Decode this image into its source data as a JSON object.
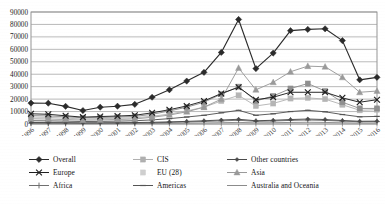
{
  "chart_data": {
    "type": "line",
    "title": "",
    "xlabel": "",
    "ylabel": "",
    "grid": true,
    "legend_position": "bottom",
    "ylim": [
      0,
      90000
    ],
    "ytick_step": 10000,
    "yticks": [
      "0",
      "10000",
      "20000",
      "30000",
      "40000",
      "50000",
      "60000",
      "70000",
      "80000",
      "90000"
    ],
    "categories": [
      "1996",
      "1997",
      "1998",
      "1999",
      "2000",
      "2001",
      "2002",
      "2003",
      "2004",
      "2005",
      "2006",
      "2007",
      "2008",
      "2009",
      "2010",
      "2011",
      "2012",
      "2013",
      "2014",
      "2015",
      "2016"
    ],
    "series": [
      {
        "name": "Overall",
        "color": "#2b2b2b",
        "marker": "diamond",
        "values": [
          16800,
          16700,
          14200,
          10800,
          13500,
          14300,
          15800,
          21500,
          27500,
          34500,
          41500,
          57500,
          84000,
          44500,
          57000,
          75000,
          76000,
          76500,
          67000,
          35500,
          37500
        ]
      },
      {
        "name": "CIS",
        "color": "#8f8f8f",
        "marker": "square",
        "values": [
          6800,
          6500,
          5800,
          5000,
          5200,
          5600,
          6100,
          7800,
          10500,
          13500,
          17500,
          24000,
          30000,
          18500,
          22500,
          28500,
          32500,
          26500,
          17500,
          12500,
          12500
        ]
      },
      {
        "name": "Other countries",
        "color": "#4a4a4a",
        "marker": "diamond-small",
        "values": [
          1200,
          1150,
          1100,
          950,
          1000,
          1050,
          1150,
          1400,
          1700,
          2100,
          2600,
          3200,
          3800,
          2600,
          3000,
          3600,
          4000,
          3600,
          2800,
          2200,
          2300
        ]
      },
      {
        "name": "Europe",
        "color": "#1f1f1f",
        "marker": "cross",
        "values": [
          8200,
          7800,
          6600,
          5500,
          6000,
          6400,
          7000,
          9000,
          11500,
          14500,
          18500,
          24500,
          29500,
          19500,
          21500,
          25500,
          25500,
          25500,
          21000,
          17500,
          19500
        ]
      },
      {
        "name": "EU (28)",
        "color": "#b5b5b5",
        "marker": "square-light",
        "values": [
          5600,
          5300,
          4700,
          4000,
          4300,
          4600,
          5000,
          6200,
          8000,
          10500,
          13500,
          18500,
          23000,
          14500,
          16500,
          20500,
          21000,
          20000,
          15500,
          11000,
          11500
        ]
      },
      {
        "name": "Asia",
        "color": "#9a9a9a",
        "marker": "triangle",
        "values": [
          4200,
          4000,
          3600,
          3100,
          3300,
          3600,
          4100,
          5400,
          7200,
          9800,
          13500,
          20000,
          45000,
          27500,
          33500,
          42000,
          46500,
          46000,
          37500,
          25500,
          26500
        ]
      },
      {
        "name": "Africa",
        "color": "#707070",
        "marker": "plus",
        "values": [
          700,
          700,
          650,
          600,
          650,
          700,
          800,
          1000,
          1300,
          1600,
          2000,
          2500,
          3000,
          2100,
          2400,
          2900,
          3200,
          2900,
          2300,
          1800,
          1900
        ]
      },
      {
        "name": "Americas",
        "color": "#555555",
        "marker": "dash",
        "values": [
          2600,
          2500,
          2300,
          2000,
          2100,
          2300,
          2600,
          3300,
          4300,
          5600,
          7000,
          9000,
          11000,
          7000,
          8200,
          10000,
          11000,
          9800,
          7600,
          5800,
          6100
        ]
      },
      {
        "name": "Australia and Oceania",
        "color": "#8c8c8c",
        "marker": "line-only",
        "values": [
          300,
          300,
          280,
          250,
          260,
          280,
          320,
          400,
          520,
          650,
          820,
          1050,
          1300,
          900,
          1050,
          1250,
          1400,
          1250,
          980,
          760,
          800
        ]
      }
    ]
  },
  "legend": {
    "items": [
      {
        "label": "Overall",
        "marker": "diamond",
        "color": "#2b2b2b"
      },
      {
        "label": "CIS",
        "marker": "square-light",
        "color": "#b0b0b0"
      },
      {
        "label": "Other countries",
        "marker": "diamond-small",
        "color": "#4a4a4a"
      },
      {
        "label": "Europe",
        "marker": "cross",
        "color": "#1f1f1f"
      },
      {
        "label": "EU (28)",
        "marker": "square-faint",
        "color": "#cfcfcf"
      },
      {
        "label": "Asia",
        "marker": "triangle",
        "color": "#9a9a9a"
      },
      {
        "label": "Africa",
        "marker": "plus",
        "color": "#707070"
      },
      {
        "label": "Americas",
        "marker": "dash",
        "color": "#555555"
      },
      {
        "label": "Australia and Oceania",
        "marker": "line-only",
        "color": "#8c8c8c"
      }
    ]
  },
  "axes": {
    "y_max_label": "90000",
    "y_min_label": "0",
    "x_first_label": "1996",
    "x_last_label": "2016"
  }
}
